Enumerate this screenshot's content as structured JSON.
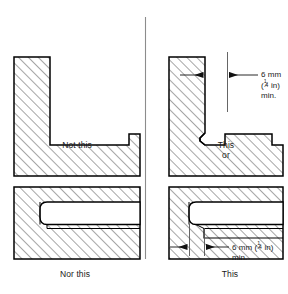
{
  "figure": {
    "type": "engineering-drawing",
    "panels": [
      {
        "id": "top-left",
        "caption": "Not this",
        "subject": "L-shaped section with sharp internal corner",
        "acceptable": false
      },
      {
        "id": "top-right",
        "caption": "This",
        "caption_extra": "or",
        "subject": "L-shaped section with relief groove at internal corner",
        "acceptable": true,
        "dimension": {
          "value_metric": "6 mm",
          "value_imperial_open": "(",
          "value_imperial_num": "1",
          "value_imperial_bar": "⁄",
          "value_imperial_den": "4",
          "value_imperial_unit": " in)",
          "qualifier": "min."
        }
      },
      {
        "id": "bottom-left",
        "caption": "Nor this",
        "subject": "Block with slot running out to the edge",
        "acceptable": false
      },
      {
        "id": "bottom-right",
        "caption": "This",
        "subject": "Block with slot stopped short, leaving clearance",
        "acceptable": true,
        "dimension": {
          "value_metric": "6 mm ",
          "value_imperial_open": "(",
          "value_imperial_num": "1",
          "value_imperial_bar": "⁄",
          "value_imperial_den": "4",
          "value_imperial_unit": " in)",
          "qualifier": "min."
        }
      }
    ]
  },
  "style": {
    "outline_color": "#000000",
    "hatch_color": "#3a3a3a",
    "divider_color": "#8c8c8c",
    "thin_color": "#555555",
    "background": "#ffffff"
  }
}
